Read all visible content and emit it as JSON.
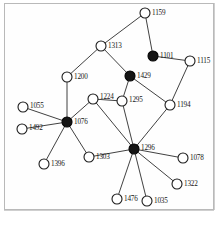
{
  "figure": {
    "type": "node-link-network-diagram",
    "background_color": "#ffffff",
    "frame_color": "#b9b9b9",
    "edge_color": "#2b2b2b",
    "node_open_fill": "#ffffff",
    "node_filled_fill": "#151515",
    "node_stroke": "#1c1c1c",
    "label_color": "#151515",
    "node_count": 19,
    "edge_count": 23,
    "hub_count": 4
  },
  "graph_data": {
    "type": "graph",
    "directed": false,
    "node_radius": 5,
    "nodes": [
      {
        "id": "1159",
        "label": "1159",
        "x": 145,
        "y": 13,
        "style": "open",
        "label_dx": 7,
        "label_dy": 2
      },
      {
        "id": "1313",
        "label": "1313",
        "x": 101,
        "y": 46,
        "style": "open",
        "label_dx": 7,
        "label_dy": 2
      },
      {
        "id": "1101",
        "label": "1101",
        "x": 153,
        "y": 56,
        "style": "filled",
        "label_dx": 7,
        "label_dy": 2
      },
      {
        "id": "1115",
        "label": "1115",
        "x": 190,
        "y": 61,
        "style": "open",
        "label_dx": 7,
        "label_dy": 2
      },
      {
        "id": "1429",
        "label": "1429",
        "x": 130,
        "y": 76,
        "style": "filled",
        "label_dx": 7,
        "label_dy": 2
      },
      {
        "id": "1200",
        "label": "1200",
        "x": 67,
        "y": 77,
        "style": "open",
        "label_dx": 7,
        "label_dy": 2
      },
      {
        "id": "1224",
        "label": "1224",
        "x": 93,
        "y": 99,
        "style": "open",
        "label_dx": 7,
        "label_dy": 0
      },
      {
        "id": "1295",
        "label": "1295",
        "x": 122,
        "y": 101,
        "style": "open",
        "label_dx": 7,
        "label_dy": 1
      },
      {
        "id": "1194",
        "label": "1194",
        "x": 170,
        "y": 105,
        "style": "open",
        "label_dx": 7,
        "label_dy": 2
      },
      {
        "id": "1055",
        "label": "1055",
        "x": 23,
        "y": 107,
        "style": "open",
        "label_dx": 7,
        "label_dy": 1
      },
      {
        "id": "1076",
        "label": "1076",
        "x": 67,
        "y": 122,
        "style": "filled",
        "label_dx": 7,
        "label_dy": 2
      },
      {
        "id": "1492",
        "label": "1492",
        "x": 22,
        "y": 129,
        "style": "open",
        "label_dx": 7,
        "label_dy": 1
      },
      {
        "id": "1296",
        "label": "1296",
        "x": 134,
        "y": 149,
        "style": "filled",
        "label_dx": 7,
        "label_dy": 1
      },
      {
        "id": "1303",
        "label": "1303",
        "x": 89,
        "y": 157,
        "style": "open",
        "label_dx": 7,
        "label_dy": 2
      },
      {
        "id": "1078",
        "label": "1078",
        "x": 183,
        "y": 158,
        "style": "open",
        "label_dx": 7,
        "label_dy": 2
      },
      {
        "id": "1396",
        "label": "1396",
        "x": 44,
        "y": 164,
        "style": "open",
        "label_dx": 7,
        "label_dy": 2
      },
      {
        "id": "1322",
        "label": "1322",
        "x": 177,
        "y": 184,
        "style": "open",
        "label_dx": 7,
        "label_dy": 2
      },
      {
        "id": "1476",
        "label": "1476",
        "x": 117,
        "y": 199,
        "style": "open",
        "label_dx": 7,
        "label_dy": 2
      },
      {
        "id": "1035",
        "label": "1035",
        "x": 147,
        "y": 201,
        "style": "open",
        "label_dx": 7,
        "label_dy": 2
      }
    ],
    "edges": [
      {
        "source": "1159",
        "target": "1313"
      },
      {
        "source": "1159",
        "target": "1101"
      },
      {
        "source": "1313",
        "target": "1200"
      },
      {
        "source": "1313",
        "target": "1429"
      },
      {
        "source": "1101",
        "target": "1115"
      },
      {
        "source": "1115",
        "target": "1194"
      },
      {
        "source": "1429",
        "target": "1295"
      },
      {
        "source": "1429",
        "target": "1194"
      },
      {
        "source": "1200",
        "target": "1076"
      },
      {
        "source": "1076",
        "target": "1055"
      },
      {
        "source": "1076",
        "target": "1492"
      },
      {
        "source": "1076",
        "target": "1396"
      },
      {
        "source": "1076",
        "target": "1303"
      },
      {
        "source": "1076",
        "target": "1224"
      },
      {
        "source": "1224",
        "target": "1295"
      },
      {
        "source": "1224",
        "target": "1296"
      },
      {
        "source": "1295",
        "target": "1296"
      },
      {
        "source": "1194",
        "target": "1296"
      },
      {
        "source": "1296",
        "target": "1303"
      },
      {
        "source": "1296",
        "target": "1078"
      },
      {
        "source": "1296",
        "target": "1322"
      },
      {
        "source": "1296",
        "target": "1476"
      },
      {
        "source": "1296",
        "target": "1035"
      }
    ]
  }
}
